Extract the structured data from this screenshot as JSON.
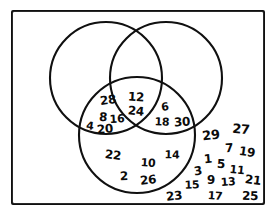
{
  "diagram": {
    "type": "venn-3-circle",
    "frame": {
      "stroke_color": "#101010",
      "fill_color": "#ffffff"
    },
    "circles": [
      {
        "name": "multiples-of-4",
        "cx": 106,
        "cy": 78,
        "r": 56,
        "stroke_color": "#101010"
      },
      {
        "name": "multiples-of-3",
        "cx": 166,
        "cy": 78,
        "r": 56,
        "stroke_color": "#101010"
      },
      {
        "name": "even-numbers",
        "cx": 137,
        "cy": 135,
        "r": 58,
        "stroke_color": "#101010"
      }
    ],
    "regions": {
      "top_left_only": {
        "label": "top-left-circle-only",
        "values": []
      },
      "top_right_only": {
        "label": "top-right-circle-only",
        "values": []
      },
      "top_pair_overlap": {
        "label": "top-left-and-top-right-only",
        "values": []
      },
      "left_lens": {
        "label": "top-left-and-bottom-only",
        "values": [
          28,
          8,
          16,
          4,
          20
        ]
      },
      "right_lens": {
        "label": "top-right-and-bottom-only",
        "values": [
          6,
          18,
          30
        ]
      },
      "center": {
        "label": "all-three-circles",
        "values": [
          12,
          24
        ]
      },
      "bottom_only": {
        "label": "bottom-circle-only",
        "values": [
          22,
          2,
          10,
          26,
          14
        ]
      },
      "outside": {
        "label": "outside-all-circles",
        "values": [
          29,
          27,
          7,
          19,
          1,
          5,
          11,
          3,
          9,
          13,
          21,
          15,
          17,
          23,
          25
        ]
      }
    },
    "numbers": [
      {
        "id": "n28",
        "text": "28",
        "x": 108,
        "y": 100,
        "size": 12
      },
      {
        "id": "n8",
        "text": "8",
        "x": 103,
        "y": 117,
        "size": 12
      },
      {
        "id": "n16",
        "text": "16",
        "x": 117,
        "y": 119,
        "size": 11
      },
      {
        "id": "n4",
        "text": "4",
        "x": 90,
        "y": 126,
        "size": 11
      },
      {
        "id": "n20",
        "text": "20",
        "x": 105,
        "y": 129,
        "size": 12
      },
      {
        "id": "n12",
        "text": "12",
        "x": 136,
        "y": 97,
        "size": 12
      },
      {
        "id": "n24",
        "text": "24",
        "x": 136,
        "y": 111,
        "size": 12
      },
      {
        "id": "n6",
        "text": "6",
        "x": 165,
        "y": 107,
        "size": 11
      },
      {
        "id": "n18",
        "text": "18",
        "x": 162,
        "y": 122,
        "size": 11
      },
      {
        "id": "n30",
        "text": "30",
        "x": 182,
        "y": 122,
        "size": 12
      },
      {
        "id": "n22",
        "text": "22",
        "x": 113,
        "y": 155,
        "size": 12
      },
      {
        "id": "n2",
        "text": "2",
        "x": 124,
        "y": 176,
        "size": 12
      },
      {
        "id": "n10",
        "text": "10",
        "x": 148,
        "y": 163,
        "size": 11
      },
      {
        "id": "n26",
        "text": "26",
        "x": 148,
        "y": 180,
        "size": 12
      },
      {
        "id": "n14",
        "text": "14",
        "x": 172,
        "y": 155,
        "size": 11
      },
      {
        "id": "n29",
        "text": "29",
        "x": 211,
        "y": 135,
        "size": 13
      },
      {
        "id": "n27",
        "text": "27",
        "x": 241,
        "y": 129,
        "size": 13
      },
      {
        "id": "n7",
        "text": "7",
        "x": 229,
        "y": 148,
        "size": 12
      },
      {
        "id": "n19",
        "text": "19",
        "x": 247,
        "y": 152,
        "size": 12
      },
      {
        "id": "n1",
        "text": "1",
        "x": 208,
        "y": 159,
        "size": 12
      },
      {
        "id": "n5",
        "text": "5",
        "x": 221,
        "y": 164,
        "size": 12
      },
      {
        "id": "n11",
        "text": "11",
        "x": 237,
        "y": 170,
        "size": 11
      },
      {
        "id": "n3",
        "text": "3",
        "x": 198,
        "y": 171,
        "size": 12
      },
      {
        "id": "n9",
        "text": "9",
        "x": 211,
        "y": 180,
        "size": 12
      },
      {
        "id": "n13",
        "text": "13",
        "x": 228,
        "y": 182,
        "size": 11
      },
      {
        "id": "n21",
        "text": "21",
        "x": 253,
        "y": 180,
        "size": 12
      },
      {
        "id": "n15",
        "text": "15",
        "x": 192,
        "y": 185,
        "size": 11
      },
      {
        "id": "n17",
        "text": "17",
        "x": 215,
        "y": 196,
        "size": 11
      },
      {
        "id": "n23",
        "text": "23",
        "x": 174,
        "y": 196,
        "size": 12
      },
      {
        "id": "n25",
        "text": "25",
        "x": 250,
        "y": 196,
        "size": 12
      }
    ]
  }
}
